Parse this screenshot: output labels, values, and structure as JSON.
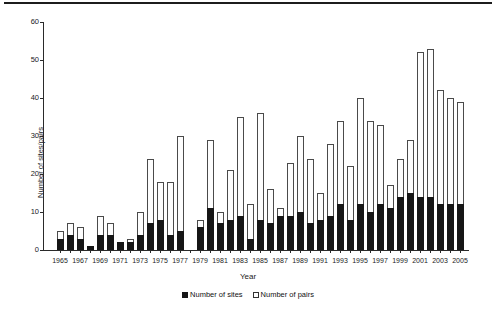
{
  "figure": {
    "y_axis_title": "Number of sites/pairs",
    "x_axis_title": "Year",
    "legend": {
      "sites_label": "Number of sites",
      "pairs_label": "Number of pairs"
    },
    "colors": {
      "sites_bar": "#161616",
      "pairs_bar_fill": "#fdfdfd",
      "pairs_bar_outline": "#4a4a4a",
      "axis": "#2a2a2a"
    }
  },
  "chart_data": {
    "type": "bar",
    "title": "",
    "xlabel": "Year",
    "ylabel": "Number of sites/pairs",
    "ylim": [
      0,
      60
    ],
    "yticks": [
      0,
      10,
      20,
      30,
      40,
      50,
      60
    ],
    "grid": false,
    "legend_position": "bottom-center",
    "x_label_every": 2,
    "categories": [
      1965,
      1966,
      1967,
      1968,
      1969,
      1970,
      1971,
      1972,
      1973,
      1974,
      1975,
      1976,
      1977,
      1978,
      1979,
      1980,
      1981,
      1982,
      1983,
      1984,
      1985,
      1986,
      1987,
      1988,
      1989,
      1990,
      1991,
      1992,
      1993,
      1994,
      1995,
      1996,
      1997,
      1998,
      1999,
      2000,
      2001,
      2002,
      2003,
      2004,
      2005
    ],
    "series": [
      {
        "name": "Number of sites",
        "style": "filled-black",
        "values": [
          3,
          4,
          3,
          1,
          4,
          4,
          2,
          2,
          4,
          7,
          8,
          4,
          5,
          0,
          6,
          11,
          7,
          8,
          9,
          3,
          8,
          7,
          9,
          9,
          10,
          7,
          8,
          9,
          12,
          8,
          12,
          10,
          12,
          11,
          14,
          15,
          14,
          14,
          12,
          12,
          12
        ]
      },
      {
        "name": "Number of pairs",
        "style": "open-white",
        "values": [
          5,
          7,
          6,
          1,
          9,
          7,
          2,
          3,
          10,
          24,
          18,
          18,
          30,
          0,
          8,
          29,
          10,
          21,
          35,
          12,
          36,
          16,
          11,
          23,
          30,
          24,
          15,
          28,
          34,
          22,
          40,
          34,
          33,
          17,
          24,
          29,
          52,
          53,
          42,
          40,
          39
        ]
      }
    ]
  }
}
